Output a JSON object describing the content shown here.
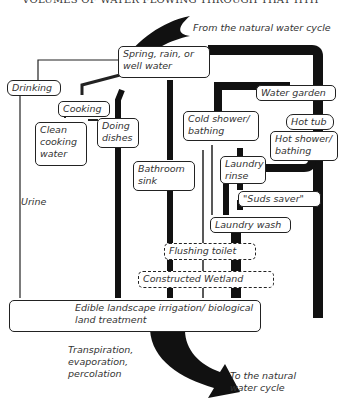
{
  "title": "VOLUMES OF WATER FLOWING THROUGH THAT HTH",
  "nodes": {
    "source": "Spring, rain, or well water",
    "drinking": "Drinking",
    "cooking": "Cooking",
    "clean_cooking": "Clean cooking water",
    "dishes": "Doing dishes",
    "bathroom_sink": "Bathroom sink",
    "water_garden": "Water garden",
    "hot_tub": "Hot tub",
    "cold_shower": "Cold shower/ bathing",
    "hot_shower": "Hot shower/ bathing",
    "laundry_rinse": "Laundry rinse",
    "suds_saver": "\"Suds saver\"",
    "laundry_wash": "Laundry wash",
    "flushing_toilet": "Flushing toilet",
    "wetland": "Constructed Wetland",
    "irrigation": "Edible landscape irrigation/ biological land treatment"
  },
  "labels": {
    "from_cycle": "From the natural water cycle",
    "urine": "Urine",
    "transpiration": "Transpiration, evaporation, percolation",
    "to_cycle": "To the natural water cycle"
  }
}
